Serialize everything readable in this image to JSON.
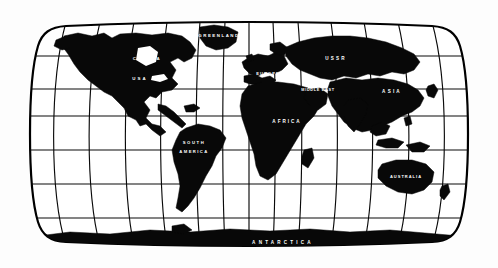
{
  "figure": {
    "projection": "robinson",
    "style": "black-and-white line art",
    "background_color": "#fdfdfd",
    "land_color": "#080808",
    "graticule_color": "#0a0a0a",
    "label_color": "#ffffff",
    "frame_color": "#000000",
    "width": 498,
    "height": 268
  },
  "graticule": {
    "meridian_count": 13,
    "parallel_count": 7,
    "meridian_spacing_degrees": 30,
    "parallel_spacing_degrees": 30,
    "grid_visible": true
  },
  "labels": [
    {
      "id": "greenland",
      "text": "GREENLAND",
      "x": 219,
      "y": 36,
      "size": 4.4,
      "spacing": 1.5
    },
    {
      "id": "canada",
      "text": "CANADA",
      "x": 147,
      "y": 59,
      "size": 4.4,
      "spacing": 1.6
    },
    {
      "id": "ussr",
      "text": "USSR",
      "x": 336,
      "y": 59,
      "size": 4.6,
      "spacing": 2.2
    },
    {
      "id": "usa",
      "text": "USA",
      "x": 140,
      "y": 79,
      "size": 4.4,
      "spacing": 2.0
    },
    {
      "id": "europe",
      "text": "EUROPE",
      "x": 268,
      "y": 74,
      "size": 4.0,
      "spacing": 1.1
    },
    {
      "id": "middle-east",
      "text": "MIDDLE EAST",
      "x": 318,
      "y": 90,
      "size": 3.8,
      "spacing": 0.7
    },
    {
      "id": "asia",
      "text": "ASIA",
      "x": 392,
      "y": 92,
      "size": 4.6,
      "spacing": 2.2
    },
    {
      "id": "africa",
      "text": "AFRICA",
      "x": 287,
      "y": 122,
      "size": 4.6,
      "spacing": 2.0
    },
    {
      "id": "south",
      "text": "SOUTH",
      "x": 194,
      "y": 143,
      "size": 4.2,
      "spacing": 1.6
    },
    {
      "id": "america",
      "text": "AMERICA",
      "x": 194,
      "y": 152,
      "size": 4.2,
      "spacing": 1.4
    },
    {
      "id": "australia",
      "text": "AUSTRALIA",
      "x": 406,
      "y": 177,
      "size": 4.0,
      "spacing": 1.0
    },
    {
      "id": "antarctica",
      "text": "ANTARCTICA",
      "x": 283,
      "y": 243,
      "size": 4.6,
      "spacing": 3.2
    }
  ],
  "chart_data": {
    "type": "map",
    "projection": "Robinson",
    "regions": [
      "GREENLAND",
      "CANADA",
      "USA",
      "SOUTH AMERICA",
      "EUROPE",
      "USSR",
      "MIDDLE EAST",
      "ASIA",
      "AFRICA",
      "AUSTRALIA",
      "ANTARCTICA"
    ],
    "graticule_degrees": {
      "meridians": 30,
      "parallels": 30
    },
    "legend": "none",
    "axis_labels": "none"
  }
}
